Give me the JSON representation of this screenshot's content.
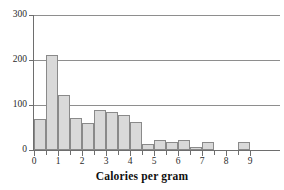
{
  "chart_data": {
    "type": "bar",
    "title": "",
    "subtitle": "",
    "xlabel": "Calories per gram",
    "ylabel": "",
    "xlim": [
      -0.25,
      9.5
    ],
    "ylim": [
      0,
      300
    ],
    "grid": "horizontal",
    "legend": "none",
    "bin_width": 0.5,
    "x_tick_labels": [
      "0",
      "1",
      "2",
      "3",
      "4",
      "5",
      "6",
      "7",
      "8",
      "9"
    ],
    "x_tick_values": [
      0,
      1,
      2,
      3,
      4,
      5,
      6,
      7,
      8,
      9
    ],
    "x_minor_tick_values": [
      0.5,
      1.5,
      2.5,
      3.5,
      4.5,
      5.5,
      6.5,
      7.5,
      8.5
    ],
    "y_tick_labels": [
      "0",
      "100",
      "200",
      "300"
    ],
    "y_tick_values": [
      0,
      100,
      200,
      300
    ],
    "bins": [
      {
        "start": 0.0,
        "end": 0.5,
        "value": 68
      },
      {
        "start": 0.5,
        "end": 1.0,
        "value": 212
      },
      {
        "start": 1.0,
        "end": 1.5,
        "value": 122
      },
      {
        "start": 1.5,
        "end": 2.0,
        "value": 71
      },
      {
        "start": 2.0,
        "end": 2.5,
        "value": 61
      },
      {
        "start": 2.5,
        "end": 3.0,
        "value": 89
      },
      {
        "start": 3.0,
        "end": 3.5,
        "value": 85
      },
      {
        "start": 3.5,
        "end": 4.0,
        "value": 78
      },
      {
        "start": 4.0,
        "end": 4.5,
        "value": 63
      },
      {
        "start": 4.5,
        "end": 5.0,
        "value": 13
      },
      {
        "start": 5.0,
        "end": 5.5,
        "value": 22
      },
      {
        "start": 5.5,
        "end": 6.0,
        "value": 18
      },
      {
        "start": 6.0,
        "end": 6.5,
        "value": 22
      },
      {
        "start": 6.5,
        "end": 7.0,
        "value": 7
      },
      {
        "start": 7.0,
        "end": 7.5,
        "value": 18
      },
      {
        "start": 8.5,
        "end": 9.0,
        "value": 18
      }
    ],
    "categories": [
      "0.0-0.5",
      "0.5-1.0",
      "1.0-1.5",
      "1.5-2.0",
      "2.0-2.5",
      "2.5-3.0",
      "3.0-3.5",
      "3.5-4.0",
      "4.0-4.5",
      "4.5-5.0",
      "5.0-5.5",
      "5.5-6.0",
      "6.0-6.5",
      "6.5-7.0",
      "7.0-7.5",
      "8.5-9.0"
    ],
    "values": [
      68,
      212,
      122,
      71,
      61,
      89,
      85,
      78,
      63,
      13,
      22,
      18,
      22,
      7,
      18,
      18
    ],
    "colors": {
      "bar_fill": "#d9d9d9",
      "bar_stroke": "#8a8a8a",
      "gridline": "#8e8e8e",
      "axis": "#6e6e6e",
      "text": "#2b2b2b",
      "background": "#ffffff"
    }
  }
}
